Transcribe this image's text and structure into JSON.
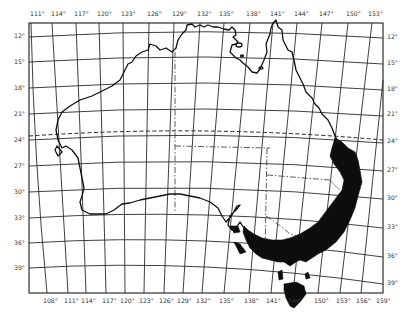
{
  "map": {
    "title": "",
    "subject": "Australia — shaded distribution range",
    "colors": {
      "background": "#ffffff",
      "lines": "#1a1a1a",
      "shaded_range": "#0d0d0d"
    },
    "top_longitude_labels": [
      "111°",
      "114°",
      "117°",
      "120°",
      "123°",
      "126°",
      "129°",
      "132°",
      "135°",
      "138°",
      "141°",
      "144°",
      "147°",
      "150°",
      "153°"
    ],
    "bottom_longitude_labels": [
      "108°",
      "111°",
      "114°",
      "117°",
      "120°",
      "123°",
      "126°",
      "129°",
      "132°",
      "135°",
      "138°",
      "141°",
      "144°",
      "150°",
      "153°",
      "156°",
      "159°"
    ],
    "left_latitude_labels": [
      "12°",
      "15°",
      "18°",
      "21°",
      "24°",
      "27°",
      "30°",
      "33°",
      "36°",
      "39°"
    ],
    "right_latitude_labels": [
      "12°",
      "15°",
      "18°",
      "21°",
      "24°",
      "27°",
      "30°",
      "33°",
      "36°",
      "39°"
    ],
    "features": {
      "tropic_line": "dashed parallel near 23.5°S",
      "state_borders": "dash-dot lines",
      "shaded_region": "east coast from ~24°S through NSW, Victoria, SE South Australia, and Tasmania"
    }
  }
}
